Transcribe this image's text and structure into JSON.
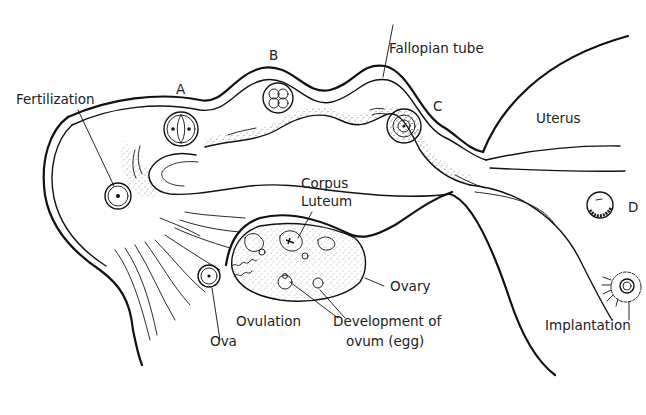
{
  "diagram": {
    "labels": {
      "fertilization": "Fertilization",
      "a": "A",
      "b": "B",
      "fallopian_tube": "Fallopian tube",
      "c": "C",
      "uterus": "Uterus",
      "d": "D",
      "corpus_luteum_line1": "Corpus",
      "corpus_luteum_line2": "Luteum",
      "ovary": "Ovary",
      "ovulation": "Ovulation",
      "ova": "Ova",
      "development_line1": "Development of",
      "development_line2": "ovum (egg)",
      "implantation": "Implantation"
    },
    "stages": [
      {
        "id": "fertilization",
        "description": "single cell with nucleus"
      },
      {
        "id": "A",
        "description": "two-cell stage"
      },
      {
        "id": "B",
        "description": "four-cell stage"
      },
      {
        "id": "C",
        "description": "morula"
      },
      {
        "id": "D",
        "description": "blastocyst"
      },
      {
        "id": "implantation",
        "description": "blastocyst implanting in uterine wall"
      }
    ],
    "colors": {
      "line": "#111111",
      "text": "#222222",
      "background": "#ffffff"
    }
  }
}
